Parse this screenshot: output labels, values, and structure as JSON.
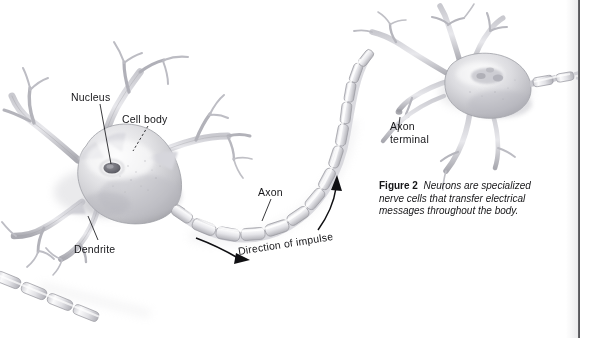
{
  "page": {
    "background_color": "#ffffff",
    "width": 595,
    "height": 338,
    "gutter_color": "#3a3a3e"
  },
  "figure": {
    "number_label": "Figure 2",
    "caption_text": "Neurons are specialized nerve cells that transfer electrical messages throughout the body.",
    "style": "pencil-shaded grayscale illustration"
  },
  "labels": {
    "nucleus": "Nucleus",
    "cell_body": "Cell body",
    "dendrite": "Dendrite",
    "axon": "Axon",
    "axon_terminal": "Axon\nterminal",
    "axon_terminal_line1": "Axon",
    "axon_terminal_line2": "terminal",
    "direction_of_impulse": "Direction of impulse"
  },
  "diagram": {
    "text_color": "#17171a",
    "line_color": "#1a1a1d",
    "cell_fill_light": "#f3f3f4",
    "cell_fill_mid": "#d3d3d6",
    "cell_fill_dark": "#9b9ba0",
    "myelin_fill": "#e9e9ec",
    "myelin_edge": "#a8a8ad",
    "parts": [
      {
        "name": "cell-body-left",
        "label": "Cell body"
      },
      {
        "name": "nucleus-left",
        "label": "Nucleus"
      },
      {
        "name": "dendrites-left",
        "label": "Dendrite"
      },
      {
        "name": "myelinated-axon",
        "label": "Axon"
      },
      {
        "name": "impulse-arrow",
        "label": "Direction of impulse"
      },
      {
        "name": "cell-body-right",
        "label": ""
      },
      {
        "name": "axon-terminal-right",
        "label": "Axon terminal"
      }
    ]
  }
}
